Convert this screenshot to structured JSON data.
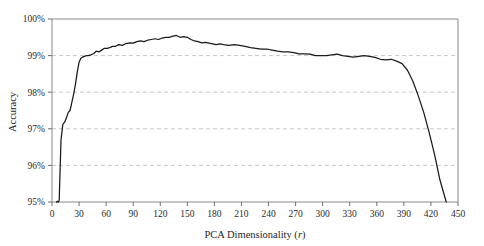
{
  "chart_data": {
    "type": "line",
    "title": "",
    "xlabel": "PCA Dimensionality (r)",
    "ylabel": "Accuracy",
    "xlim": [
      0,
      450
    ],
    "ylim": [
      95,
      100
    ],
    "grid": true,
    "legend": "none",
    "x_ticks": [
      0,
      30,
      60,
      90,
      120,
      150,
      180,
      210,
      240,
      270,
      300,
      330,
      360,
      390,
      420,
      450
    ],
    "x_tick_labels": [
      "0",
      "30",
      "60",
      "90",
      "120",
      "150",
      "180",
      "210",
      "240",
      "270",
      "300",
      "330",
      "360",
      "390",
      "420",
      "450"
    ],
    "y_ticks": [
      95,
      96,
      97,
      98,
      99,
      100
    ],
    "y_tick_labels": [
      "95%",
      "96%",
      "97%",
      "98%",
      "99%",
      "100%"
    ],
    "series": [
      {
        "name": "Accuracy vs PCA dimensionality",
        "color": "#1a1a1a",
        "x": [
          5,
          6,
          7,
          8,
          9,
          10,
          12,
          14,
          16,
          18,
          20,
          22,
          24,
          26,
          28,
          30,
          32,
          34,
          36,
          38,
          40,
          43,
          46,
          49,
          52,
          55,
          58,
          61,
          64,
          67,
          70,
          74,
          78,
          82,
          86,
          90,
          94,
          98,
          102,
          106,
          110,
          114,
          118,
          122,
          126,
          130,
          134,
          138,
          142,
          146,
          150,
          154,
          158,
          162,
          166,
          170,
          174,
          178,
          182,
          186,
          190,
          196,
          202,
          208,
          214,
          220,
          226,
          232,
          238,
          244,
          250,
          256,
          262,
          268,
          274,
          280,
          286,
          292,
          298,
          304,
          310,
          316,
          322,
          328,
          334,
          340,
          346,
          352,
          358,
          364,
          370,
          376,
          382,
          388,
          394,
          400,
          406,
          412,
          418,
          424,
          430,
          437
        ],
        "y": [
          95.0,
          95.02,
          95.0,
          95.05,
          95.9,
          96.7,
          97.12,
          97.18,
          97.3,
          97.45,
          97.5,
          97.72,
          97.95,
          98.22,
          98.55,
          98.82,
          98.93,
          98.96,
          98.98,
          99.0,
          99.0,
          99.02,
          99.05,
          99.12,
          99.1,
          99.15,
          99.2,
          99.2,
          99.22,
          99.25,
          99.25,
          99.3,
          99.28,
          99.33,
          99.35,
          99.34,
          99.38,
          99.4,
          99.38,
          99.42,
          99.44,
          99.46,
          99.44,
          99.48,
          99.5,
          99.5,
          99.53,
          99.55,
          99.5,
          99.52,
          99.5,
          99.44,
          99.4,
          99.38,
          99.35,
          99.36,
          99.34,
          99.32,
          99.3,
          99.32,
          99.3,
          99.28,
          99.3,
          99.28,
          99.25,
          99.22,
          99.2,
          99.18,
          99.18,
          99.15,
          99.12,
          99.1,
          99.1,
          99.08,
          99.05,
          99.05,
          99.04,
          99.0,
          99.0,
          99.0,
          99.02,
          99.04,
          99.0,
          98.98,
          98.96,
          98.98,
          99.0,
          98.98,
          98.95,
          98.9,
          98.88,
          98.9,
          98.85,
          98.78,
          98.6,
          98.3,
          97.9,
          97.45,
          96.9,
          96.3,
          95.6,
          95.0
        ]
      }
    ]
  }
}
